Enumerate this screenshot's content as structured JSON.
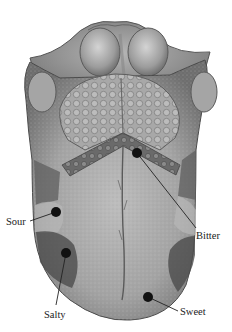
{
  "diagram": {
    "labels": {
      "sour": "Sour",
      "bitter": "Bitter",
      "salty": "Salty",
      "sweet": "Sweet"
    },
    "colors": {
      "background": "#ffffff",
      "tongue_base": "#9a9a9a",
      "tongue_dark": "#5e5e5e",
      "tongue_light": "#c9c9c9",
      "marker": "#111111",
      "leader_line": "#222222",
      "label_text": "#222222"
    }
  }
}
